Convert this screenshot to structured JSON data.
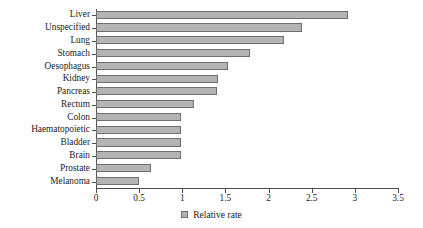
{
  "chart_data": {
    "type": "bar",
    "orientation": "horizontal",
    "title": "",
    "xlabel": "",
    "ylabel": "",
    "xlim": [
      0,
      3.5
    ],
    "xticks": [
      "0",
      "0.5",
      "1",
      "1.5",
      "2",
      "2.5",
      "3",
      "3.5"
    ],
    "xtick_values": [
      0,
      0.5,
      1,
      1.5,
      2,
      2.5,
      3,
      3.5
    ],
    "grid": false,
    "legend_position": "bottom",
    "legend": [
      "Relative rate"
    ],
    "series_name": "Relative rate",
    "bar_color": "#b4b4b4",
    "bar_edge_color": "#6e6e6e",
    "categories": [
      "Liver",
      "Unspecified",
      "Lung",
      "Stomach",
      "Oesophagus",
      "Kidney",
      "Pancreas",
      "Rectum",
      "Colon",
      "Haematopoietic",
      "Bladder",
      "Brain",
      "Prostate",
      "Melanoma"
    ],
    "values": [
      2.92,
      2.39,
      2.18,
      1.78,
      1.53,
      1.41,
      1.4,
      1.14,
      0.99,
      0.99,
      0.99,
      0.99,
      0.64,
      0.5
    ]
  },
  "legend": {
    "label": "Relative rate",
    "swatch_icon": "square-swatch-icon"
  }
}
